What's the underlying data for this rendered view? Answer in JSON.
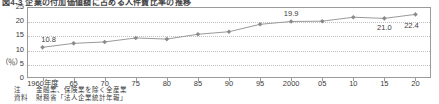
{
  "figure": {
    "title": "図4-3  企業の付加価値額に占める人件費比率の推移",
    "unit_label": "（％）"
  },
  "notes": [
    {
      "key": "注",
      "text": "金融業、保険業を除く全産業"
    },
    {
      "key": "資料",
      "text": "財務省「法人企業統計年報」"
    }
  ],
  "chart_data": {
    "type": "line",
    "title": "図4-3  企業の付加価値額に占める人件費比率の推移",
    "xlabel": "",
    "ylabel": "（％）",
    "ylim": [
      0,
      25
    ],
    "yticks": [
      0,
      5,
      10,
      15,
      20,
      25
    ],
    "grid": true,
    "legend": "none",
    "marker": "diamond",
    "series_color": "#8a8a8a",
    "line_color": "#9a9a9a",
    "categories": [
      "1960年度",
      "65",
      "70",
      "75",
      "80",
      "85",
      "90",
      "95",
      "2000",
      "05",
      "10",
      "15",
      "20"
    ],
    "x": [
      1960,
      1965,
      1970,
      1975,
      1980,
      1985,
      1990,
      1995,
      2000,
      2005,
      2010,
      2015,
      2020
    ],
    "values": [
      10.8,
      12.2,
      12.7,
      14.1,
      13.7,
      15.4,
      16.3,
      18.9,
      19.9,
      20.0,
      21.4,
      21.0,
      22.4
    ],
    "point_labels": [
      {
        "index": 0,
        "text": "10.8"
      },
      {
        "index": 8,
        "text": "19.9"
      },
      {
        "index": 11,
        "text": "21.0"
      },
      {
        "index": 12,
        "text": "22.4"
      }
    ]
  }
}
